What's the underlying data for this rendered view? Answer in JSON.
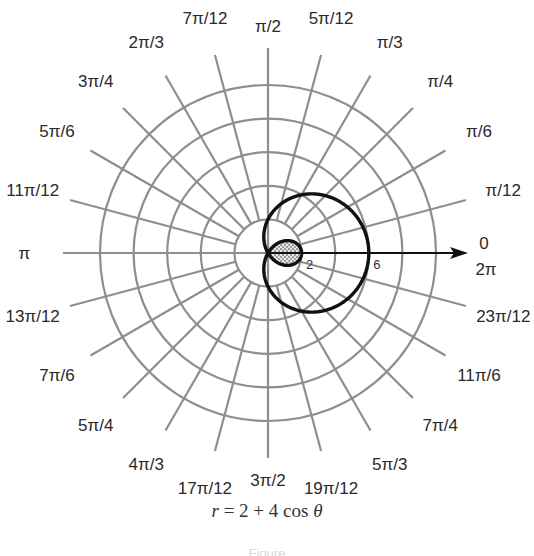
{
  "chart_data": {
    "type": "polar-line",
    "title": "",
    "equation": "r = 2 + 4 cos θ",
    "caption": {
      "var": "r",
      "rhs": " = 2 + 4 cos ",
      "theta": "θ"
    },
    "center_px": [
      268,
      253
    ],
    "px_per_unit": 16.8,
    "rings": [
      2,
      4,
      6,
      8,
      10
    ],
    "spoke_start_r": 2,
    "spoke_end_r": 12.2,
    "angle_step_deg": 15,
    "radial_tick_labels": [
      {
        "value": 2,
        "label": "2"
      },
      {
        "value": 6,
        "label": "6"
      }
    ],
    "polar_axis": {
      "label_top": "0",
      "label_bottom": "2π",
      "arrow": true
    },
    "angle_labels": [
      {
        "deg": 15,
        "label": "π/12"
      },
      {
        "deg": 30,
        "label": "π/6"
      },
      {
        "deg": 45,
        "label": "π/4"
      },
      {
        "deg": 60,
        "label": "π/3"
      },
      {
        "deg": 75,
        "label": "5π/12"
      },
      {
        "deg": 90,
        "label": "π/2"
      },
      {
        "deg": 105,
        "label": "7π/12"
      },
      {
        "deg": 120,
        "label": "2π/3"
      },
      {
        "deg": 135,
        "label": "3π/4"
      },
      {
        "deg": 150,
        "label": "5π/6"
      },
      {
        "deg": 165,
        "label": "11π/12"
      },
      {
        "deg": 180,
        "label": "π"
      },
      {
        "deg": 195,
        "label": "13π/12"
      },
      {
        "deg": 210,
        "label": "7π/6"
      },
      {
        "deg": 225,
        "label": "5π/4"
      },
      {
        "deg": 240,
        "label": "4π/3"
      },
      {
        "deg": 255,
        "label": "17π/12"
      },
      {
        "deg": 270,
        "label": "3π/2"
      },
      {
        "deg": 285,
        "label": "19π/12"
      },
      {
        "deg": 300,
        "label": "5π/3"
      },
      {
        "deg": 315,
        "label": "7π/4"
      },
      {
        "deg": 330,
        "label": "11π/6"
      },
      {
        "deg": 345,
        "label": "23π/12"
      }
    ],
    "series": [
      {
        "name": "r = 2 + 4 cos θ",
        "a": 2,
        "b": 4,
        "theta_range": [
          0,
          6.283185
        ],
        "key_points": [
          {
            "theta": "0",
            "r": 6
          },
          {
            "theta": "π/2",
            "r": 2
          },
          {
            "theta": "2π/3",
            "r": 0
          },
          {
            "theta": "π",
            "r": -2
          },
          {
            "theta": "4π/3",
            "r": 0
          },
          {
            "theta": "3π/2",
            "r": 2
          }
        ],
        "inner_loop_shaded": true
      }
    ],
    "colors": {
      "grid": "#8e8e8e",
      "curve": "#111111",
      "axis": "#111111",
      "shade": "#c8c8c8",
      "text": "#2a2a2a"
    }
  },
  "footer_note": "Figure"
}
